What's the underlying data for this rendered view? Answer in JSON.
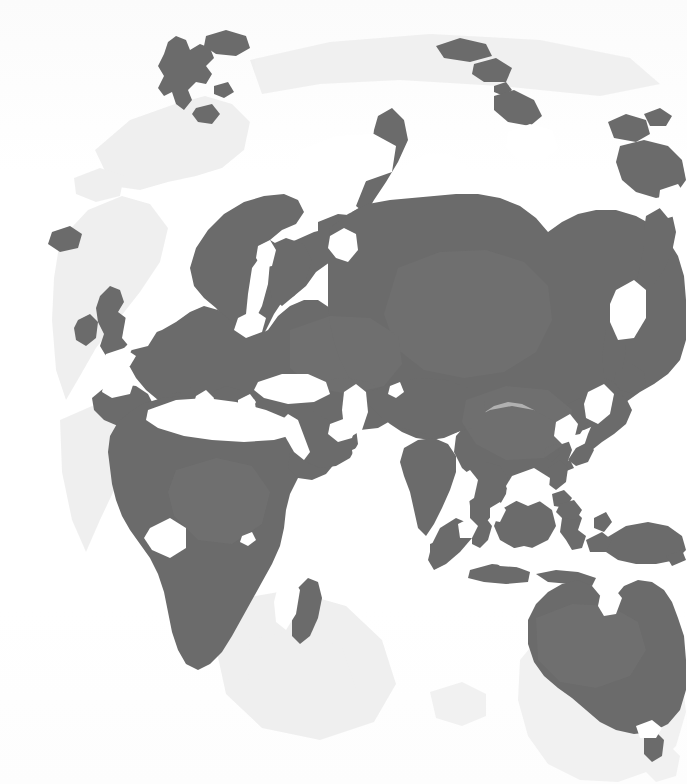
{
  "figure": {
    "kind": "world-map-illustration",
    "width": 687,
    "height": 784
  },
  "palette": {
    "background": "#ffffff",
    "land": "#6b6b6b",
    "land_mid": "#6f6f6f",
    "land_light": "#737373",
    "ghost": "#f1f1f1",
    "halo": "#ededed"
  },
  "regions": [
    {
      "name": "Svalbard",
      "label": "Svalbard"
    },
    {
      "name": "Scandinavia",
      "label": "Scandinavia"
    },
    {
      "name": "British Isles",
      "label": "British Isles"
    },
    {
      "name": "Iberian Peninsula",
      "label": "Iberia"
    },
    {
      "name": "Continental Europe",
      "label": "Europe"
    },
    {
      "name": "Italy",
      "label": "Italy"
    },
    {
      "name": "Black Sea",
      "label": "Black Sea"
    },
    {
      "name": "Mediterranean Sea",
      "label": "Mediterranean"
    },
    {
      "name": "Russia / Siberia",
      "label": "Siberia"
    },
    {
      "name": "Novaya Zemlya",
      "label": "Novaya Zemlya"
    },
    {
      "name": "Kamchatka",
      "label": "Kamchatka"
    },
    {
      "name": "Sakhalin",
      "label": "Sakhalin"
    },
    {
      "name": "Japan",
      "label": "Japan"
    },
    {
      "name": "Korean Peninsula",
      "label": "Korea"
    },
    {
      "name": "China",
      "label": "China"
    },
    {
      "name": "India",
      "label": "India"
    },
    {
      "name": "Sri Lanka",
      "label": "Sri Lanka"
    },
    {
      "name": "Arabian Peninsula",
      "label": "Arabia"
    },
    {
      "name": "Red Sea",
      "label": "Red Sea"
    },
    {
      "name": "Persian Gulf",
      "label": "Persian Gulf"
    },
    {
      "name": "Africa",
      "label": "Africa"
    },
    {
      "name": "Madagascar",
      "label": "Madagascar"
    },
    {
      "name": "Indochina",
      "label": "Indochina"
    },
    {
      "name": "Sumatra",
      "label": "Sumatra"
    },
    {
      "name": "Java",
      "label": "Java"
    },
    {
      "name": "Borneo",
      "label": "Borneo"
    },
    {
      "name": "Sulawesi",
      "label": "Sulawesi"
    },
    {
      "name": "Philippines",
      "label": "Philippines"
    },
    {
      "name": "New Guinea",
      "label": "New Guinea"
    },
    {
      "name": "Australia",
      "label": "Australia"
    },
    {
      "name": "Tasmania",
      "label": "Tasmania"
    }
  ]
}
